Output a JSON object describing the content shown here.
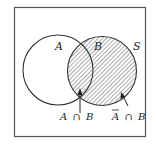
{
  "diagram": {
    "type": "venn",
    "universe_label": "S",
    "sets": [
      {
        "id": "A",
        "label": "A",
        "hatched": false
      },
      {
        "id": "B",
        "label": "B",
        "hatched": true
      }
    ],
    "annotations": [
      {
        "id": "a-and-b",
        "label_left": "A",
        "op": "∩",
        "label_right": "B",
        "target": "intersection of A and B"
      },
      {
        "id": "not-a-and-b",
        "label_left": "A",
        "label_left_overline": true,
        "op": "∩",
        "label_right": "B",
        "target": "B outside A"
      }
    ],
    "colors": {
      "stroke": "#333333",
      "hatch": "#555555",
      "background": "#ffffff"
    }
  }
}
